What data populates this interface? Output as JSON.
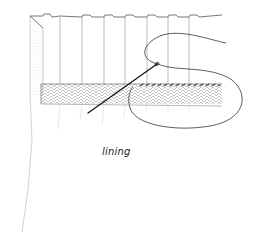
{
  "diagram": {
    "labels": {
      "lining": "lining"
    },
    "colors": {
      "pencil": "#555555",
      "faint_pencil": "#b8b8b8",
      "hatch": "#9a9a9a",
      "needle": "#1a1a1a",
      "background": "#ffffff"
    },
    "parts": [
      "curtain-fabric",
      "pleats",
      "lining-hem-band",
      "needle",
      "thread-loop",
      "stitches"
    ]
  }
}
